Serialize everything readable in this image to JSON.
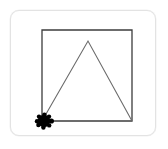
{
  "canvas": {
    "name": "turtle-graphics-canvas",
    "background_color": "#ffffff",
    "border_color": "#e3e3e3",
    "width": 146,
    "height": 126
  },
  "drawing": {
    "title": "Turtle drawing: square with inscribed triangle",
    "stroke_color": "#3c3c3c",
    "stroke_width": 1.2,
    "shapes": [
      {
        "name": "square",
        "type": "polygon",
        "closed": true,
        "points": "31,19 121,19 121,110 31,110",
        "stroke_color": "#3c3c3c",
        "stroke_width": 1.3
      },
      {
        "name": "triangle",
        "type": "polyline",
        "closed": false,
        "points": "31,110 77,30 121,110",
        "stroke_color": "#6b6b6b",
        "stroke_width": 1.1
      }
    ]
  },
  "turtle": {
    "name": "turtle-cursor",
    "color": "#000000",
    "x": 33,
    "y": 110,
    "heading_degrees": 0,
    "heading_label": "east",
    "body_radius": 6.2,
    "leg_radius": 2.2,
    "legs": [
      {
        "dx": -5.0,
        "dy": -4.4
      },
      {
        "dx": 5.0,
        "dy": -4.4
      },
      {
        "dx": -5.6,
        "dy": 4.0
      },
      {
        "dx": 5.2,
        "dy": 4.4
      },
      {
        "dx": -7.0,
        "dy": 0.2
      },
      {
        "dx": 0.4,
        "dy": -6.4
      },
      {
        "dx": -0.6,
        "dy": 6.6
      }
    ],
    "head": {
      "dx": 7.4,
      "dy": 0.0,
      "r": 2.6
    }
  }
}
